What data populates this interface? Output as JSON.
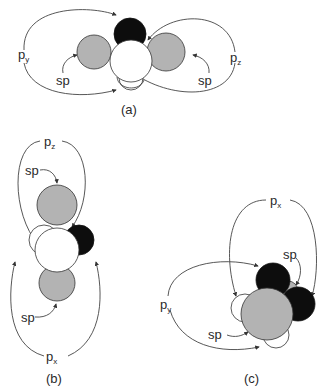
{
  "figure": {
    "panels": [
      {
        "id": "a",
        "caption": "(a)",
        "labels": {
          "left_p": "p",
          "left_p_sub": "y",
          "right_p": "p",
          "right_p_sub": "z",
          "left_sp": "sp",
          "right_sp": "sp"
        }
      },
      {
        "id": "b",
        "caption": "(b)",
        "labels": {
          "top_p": "p",
          "top_p_sub": "z",
          "bottom_p": "p",
          "bottom_p_sub": "x",
          "top_sp": "sp",
          "bottom_sp": "sp"
        }
      },
      {
        "id": "c",
        "caption": "(c)",
        "labels": {
          "top_p": "p",
          "top_p_sub": "x",
          "left_p": "p",
          "left_p_sub": "y",
          "upper_sp": "sp",
          "lower_sp": "sp"
        }
      }
    ],
    "colors": {
      "gray_lobe": "#b3b3b3",
      "black_lobe": "#0d0d0d",
      "white_lobe": "#ffffff",
      "outline": "#333333"
    }
  }
}
